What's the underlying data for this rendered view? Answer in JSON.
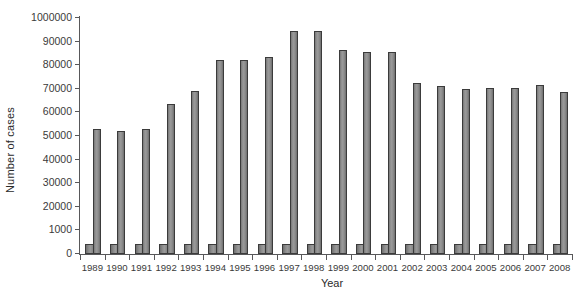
{
  "chart_data": {
    "type": "bar",
    "title": "",
    "subtitle": "",
    "xlabel": "Year",
    "ylabel": "Number of cases",
    "categories": [
      "1989",
      "1990",
      "1991",
      "1992",
      "1993",
      "1994",
      "1995",
      "1996",
      "1997",
      "1998",
      "1999",
      "2000",
      "2001",
      "2002",
      "2003",
      "2004",
      "2005",
      "2006",
      "2007",
      "2008"
    ],
    "ytick_labels": [
      "0",
      "1000",
      "20000",
      "30000",
      "40000",
      "50000",
      "60000",
      "70000",
      "80000",
      "90000",
      "1000000"
    ],
    "ytick_values": [
      0,
      10000,
      20000,
      30000,
      40000,
      50000,
      60000,
      70000,
      80000,
      90000,
      100000
    ],
    "ylim": [
      0,
      100000
    ],
    "grid": false,
    "legend": null,
    "series": [
      {
        "name": "short-bar-series",
        "style": "short wide bar, left of pair",
        "values": [
          2700,
          2700,
          2700,
          2700,
          2700,
          2700,
          2700,
          2700,
          2700,
          2700,
          2700,
          2700,
          2700,
          2700,
          2700,
          2700,
          2700,
          2700,
          2700,
          2700
        ]
      },
      {
        "name": "tall-bar-series",
        "style": "tall narrow bar, right of pair",
        "values": [
          53000,
          52000,
          53000,
          63500,
          69000,
          82000,
          82000,
          83500,
          94500,
          94500,
          86500,
          85500,
          85500,
          72500,
          71000,
          70000,
          70500,
          70500,
          71500,
          68500
        ]
      }
    ]
  },
  "axis": {
    "y_axis_label": "Number of cases",
    "x_axis_label": "Year"
  },
  "colors": {
    "bar_fill": "#8e8e8e",
    "bar_edge": "#3b3b3b",
    "axis": "#58585a",
    "text": "#2b2b2b",
    "background": "#ffffff"
  }
}
